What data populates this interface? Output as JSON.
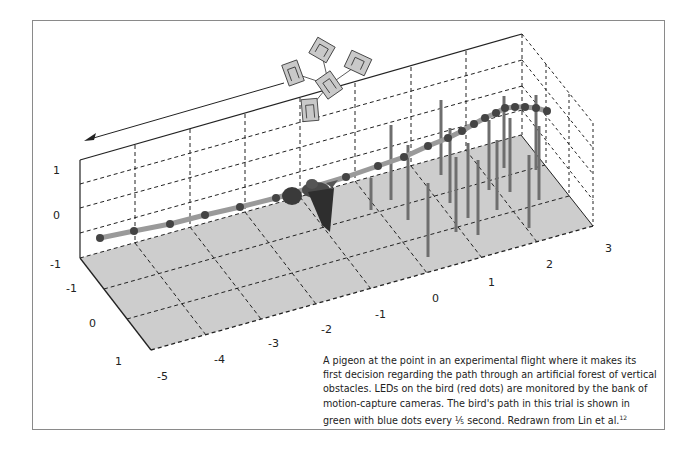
{
  "figure": {
    "caption": "A pigeon at the point in an experimental flight where it makes its first decision regarding the path through an artificial forest of vertical obstacles. LEDs on the bird (red dots) are monitored by the bank of motion-capture cameras. The bird's path in this trial is shown in green with blue dots every ⅕ second. Redrawn from Lin et al.",
    "citation_superscript": "12",
    "flight_direction_arrow": "arrow-left",
    "axes": {
      "z_ticks": [
        "1",
        "0",
        "-1"
      ],
      "y_ticks": [
        "-1",
        "0",
        "1"
      ],
      "x_ticks": [
        "-5",
        "-4",
        "-3",
        "-2",
        "-1",
        "0",
        "1",
        "2",
        "3"
      ]
    },
    "colors": {
      "floor": "#c8c8c8",
      "path_line": "#9a9a9a",
      "path_dots": "#444444",
      "obstacles": "#6e6e6e",
      "cameras": "#c9c9c9",
      "frame_border": "#8a8a8a"
    },
    "camera_count": 5,
    "obstacle_count": 16
  }
}
